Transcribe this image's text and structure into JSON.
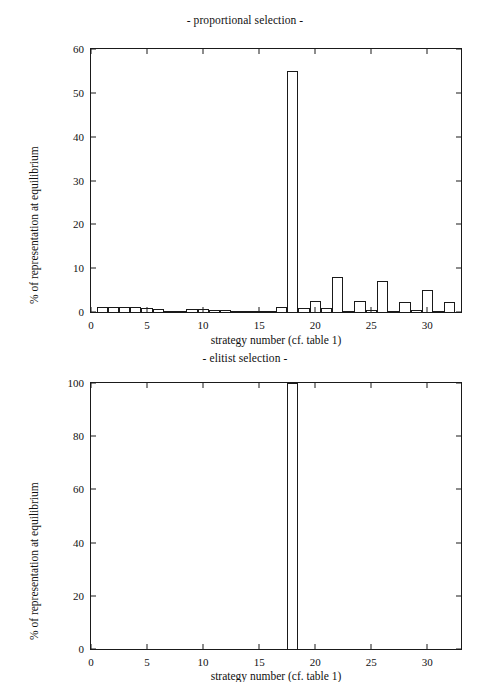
{
  "chart_data": [
    {
      "type": "bar",
      "title": "- proportional selection -",
      "xlabel": "strategy number (cf. table 1)",
      "ylabel": "% of representation at equilibrium",
      "xlim": [
        0,
        33
      ],
      "ylim": [
        0,
        60
      ],
      "xticks": [
        0,
        5,
        10,
        15,
        20,
        25,
        30
      ],
      "yticks": [
        0,
        10,
        20,
        30,
        40,
        50,
        60
      ],
      "grid": false,
      "legend": null,
      "categories": [
        1,
        2,
        3,
        4,
        5,
        6,
        7,
        8,
        9,
        10,
        11,
        12,
        13,
        14,
        15,
        16,
        17,
        18,
        19,
        20,
        21,
        22,
        23,
        24,
        25,
        26,
        27,
        28,
        29,
        30,
        31,
        32
      ],
      "values": [
        1.2,
        1.2,
        1.2,
        1.2,
        0.9,
        0.6,
        0.1,
        0.1,
        0.6,
        0.6,
        0.4,
        0.4,
        0.3,
        0.3,
        0.3,
        0.2,
        1.2,
        55.0,
        1.0,
        2.6,
        1.0,
        8.0,
        0.2,
        2.5,
        0.4,
        7.0,
        0.2,
        2.2,
        0.4,
        5.0,
        0.2,
        2.2
      ]
    },
    {
      "type": "bar",
      "title": "- elitist selection -",
      "xlabel": "strategy number (cf. table 1)",
      "ylabel": "% of representation at equilibrium",
      "xlim": [
        0,
        33
      ],
      "ylim": [
        0,
        100
      ],
      "xticks": [
        0,
        5,
        10,
        15,
        20,
        25,
        30
      ],
      "yticks": [
        0,
        20,
        40,
        60,
        80,
        100
      ],
      "grid": false,
      "legend": null,
      "categories": [
        1,
        2,
        3,
        4,
        5,
        6,
        7,
        8,
        9,
        10,
        11,
        12,
        13,
        14,
        15,
        16,
        17,
        18,
        19,
        20,
        21,
        22,
        23,
        24,
        25,
        26,
        27,
        28,
        29,
        30,
        31,
        32
      ],
      "values": [
        0,
        0,
        0,
        0,
        0,
        0,
        0,
        0,
        0,
        0,
        0,
        0,
        0,
        0,
        0,
        0,
        0,
        100,
        0,
        0,
        0,
        0,
        0,
        0,
        0,
        0,
        0,
        0,
        0,
        0,
        0,
        0
      ]
    }
  ],
  "figures": {
    "top": {
      "title": "- proportional selection -",
      "xlabel": "strategy number (cf. table 1)",
      "ylabel": "% of representation at equilibrium"
    },
    "bottom": {
      "title": "- elitist selection -",
      "xlabel": "strategy number (cf. table 1)",
      "ylabel": "% of representation at equilibrium"
    }
  },
  "colors": {
    "axis": "#1a1a1a",
    "bar_fill": "#ffffff",
    "bar_stroke": "#1a1a1a",
    "background": "#ffffff"
  }
}
